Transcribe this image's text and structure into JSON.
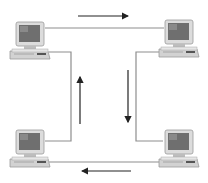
{
  "diagram": {
    "type": "ring-network",
    "colors": {
      "background": "#ffffff",
      "line": "#8a8a8a",
      "arrow": "#222222",
      "monitor_body": "#d8d8d8",
      "screen": "#7a7a7a",
      "base": "#cfcfcf"
    },
    "nodes": [
      {
        "id": "computer-top-left",
        "icon": "desktop-computer-icon"
      },
      {
        "id": "computer-top-right",
        "icon": "desktop-computer-icon"
      },
      {
        "id": "computer-bottom-right",
        "icon": "desktop-computer-icon"
      },
      {
        "id": "computer-bottom-left",
        "icon": "desktop-computer-icon"
      }
    ],
    "flow": [
      "right",
      "down",
      "left",
      "up"
    ]
  }
}
